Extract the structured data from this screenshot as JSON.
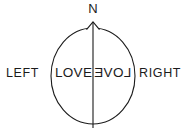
{
  "figure": {
    "type": "head-orientation-diagram",
    "background_color": "#ffffff",
    "stroke_color": "#1b1b1b",
    "text_color": "#1b1b1b",
    "orientation": {
      "north_label": "N",
      "nose_marker": "triangle"
    },
    "sides": {
      "left_label": "LEFT",
      "right_label": "RIGHT"
    },
    "hemispheres": {
      "left_word": "LOVE",
      "right_word": "LOVE",
      "right_word_mirrored": true
    },
    "shapes": {
      "outline": "ellipse",
      "midline": "vertical-line"
    }
  }
}
